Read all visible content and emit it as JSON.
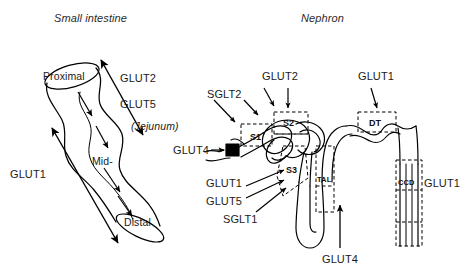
{
  "figure": {
    "kind": "scientific-diagram",
    "background_color": "#ffffff",
    "ink_color": "#000000",
    "panels": [
      {
        "id": "small-intestine",
        "title": "Small intestine"
      },
      {
        "id": "nephron",
        "title": "Nephron"
      }
    ]
  },
  "small_intestine": {
    "title": "Small intestine",
    "tube_labels": {
      "proximal": "Proximal",
      "mid": "Mid-",
      "distal": "Distal"
    },
    "transporters": {
      "glut2": "GLUT2",
      "glut5": "GLUT5",
      "jejunum": "(Jejunum)",
      "glut1": "GLUT1"
    },
    "arrow_notes": {
      "flow_arrows": 4,
      "gradient_arrow_right": "double-headed arrow spanning proximal to distal alongside GLUT2/GLUT5",
      "gradient_arrow_left": "double-headed arrow spanning proximal to distal alongside GLUT1"
    }
  },
  "nephron": {
    "title": "Nephron",
    "segments": {
      "s1": "S1",
      "s2": "S2",
      "s3": "S3",
      "dt": "DT",
      "tal": "TAL",
      "ccd": "CCD"
    },
    "transporters": {
      "sglt2": "SGLT2",
      "glut2": "GLUT2",
      "glut1_top": "GLUT1",
      "glut4_left": "GLUT4",
      "glut1_left": "GLUT1",
      "glut5_left": "GLUT5",
      "sglt1_left": "SGLT1",
      "glut1_right": "GLUT1",
      "glut4_bottom": "GLUT4"
    },
    "arrow_notes": {
      "sglt2_arrows": 2,
      "glut2_arrows": 2,
      "glut1_top_arrows": 1,
      "glut4_left_arrows": 1,
      "s3_cluster_arrows": 3,
      "glut4_bottom_arrows": 1
    },
    "glomerulus": "filled black square at proximal end of tubule"
  }
}
